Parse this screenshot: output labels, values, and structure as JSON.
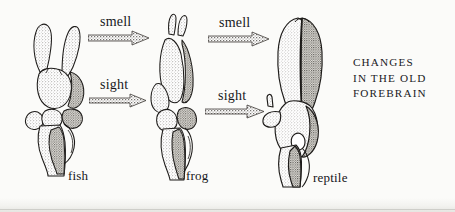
{
  "figure": {
    "caption_lines": [
      "CHANGES",
      "IN THE OLD",
      "FOREBRAIN"
    ],
    "background_color": "#fbfbf9",
    "ink_color": "#16161a"
  },
  "specimens": [
    {
      "id": "fish",
      "label": "fish",
      "order": 1
    },
    {
      "id": "frog",
      "label": "frog",
      "order": 2
    },
    {
      "id": "reptile",
      "label": "reptile",
      "order": 3
    }
  ],
  "arrows": [
    {
      "id": "smell-fish-to-frog",
      "label": "smell",
      "from": "fish",
      "to": "frog",
      "sense": "smell"
    },
    {
      "id": "smell-frog-to-reptile",
      "label": "smell",
      "from": "frog",
      "to": "reptile",
      "sense": "smell"
    },
    {
      "id": "sight-fish-to-frog",
      "label": "sight",
      "from": "fish",
      "to": "frog",
      "sense": "sight"
    },
    {
      "id": "sight-frog-to-reptile",
      "label": "sight",
      "from": "frog",
      "to": "reptile",
      "sense": "sight"
    }
  ]
}
